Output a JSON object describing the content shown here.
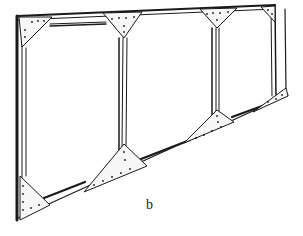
{
  "figure": {
    "caption": "b",
    "bays": 3,
    "colors": {
      "ink": "#1a1a1a",
      "paper": "#ffffff",
      "plate": "#f4f4f4"
    }
  }
}
